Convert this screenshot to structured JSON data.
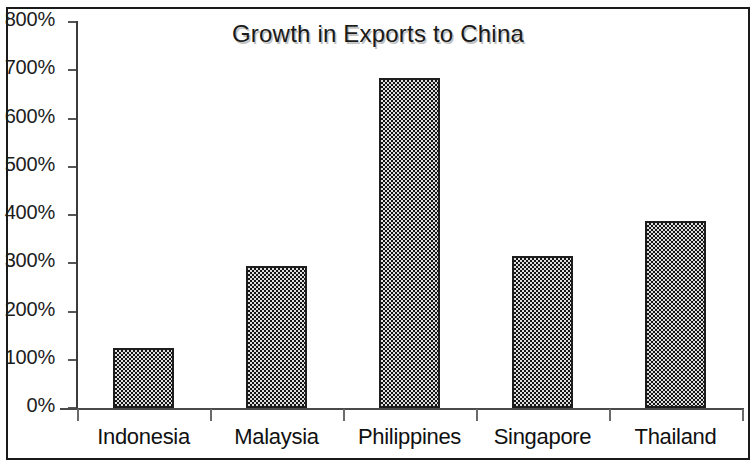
{
  "chart_data": {
    "type": "bar",
    "title": "Growth in Exports to China",
    "xlabel": "",
    "ylabel": "",
    "categories": [
      "Indonesia",
      "Malaysia",
      "Philippines",
      "Singapore",
      "Thailand"
    ],
    "values": [
      124,
      294,
      684,
      315,
      387
    ],
    "value_labels": [
      "124%",
      "294%",
      "684%",
      "315%",
      "387%"
    ],
    "ytick_labels": [
      "0%",
      "100%",
      "200%",
      "300%",
      "400%",
      "500%",
      "600%",
      "700%",
      "800%"
    ],
    "ytick_values": [
      0,
      100,
      200,
      300,
      400,
      500,
      600,
      700,
      800
    ],
    "ylim": [
      0,
      800
    ],
    "grid": false,
    "legend": "none",
    "bar_fill": "#4e4e4e",
    "bar_border": "#1e1e1e",
    "axis_color": "#3b3b3b",
    "background": "#ffffff",
    "units": "percent"
  }
}
